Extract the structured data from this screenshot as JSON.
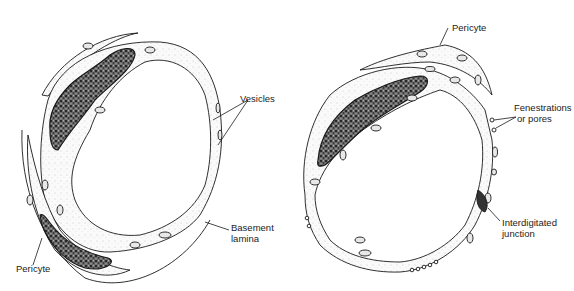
{
  "figure": {
    "panels": [
      {
        "id": "continuous-capillary",
        "labels": {
          "vesicles": "Vesicles",
          "basement_lamina_line1": "Basement",
          "basement_lamina_line2": "lamina",
          "pericyte": "Pericyte"
        }
      },
      {
        "id": "fenestrated-capillary",
        "labels": {
          "pericyte": "Pericyte",
          "fenestrations_line1": "Fenestrations",
          "fenestrations_line2": "or pores",
          "junction_line1": "Interdigitated",
          "junction_line2": "junction"
        }
      }
    ],
    "colors": {
      "line": "#1a1a1a",
      "nucleus_fill": "#2a2a2a",
      "cytoplasm_fill": "#f4f4f4",
      "background": "#ffffff"
    }
  }
}
